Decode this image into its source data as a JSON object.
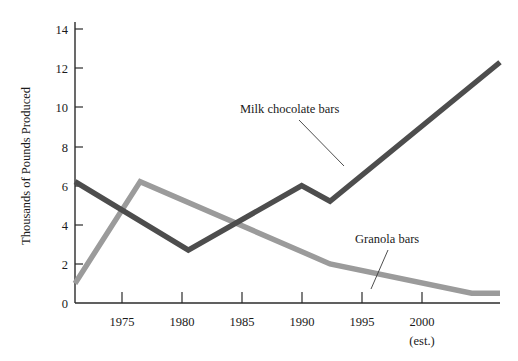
{
  "chart_data": {
    "type": "line",
    "title": "",
    "xlabel": "",
    "ylabel": "Thousands of Pounds Produced",
    "xlim": [
      1972,
      2002
    ],
    "ylim": [
      0,
      15
    ],
    "grid": false,
    "legend_position": "inline-annotations",
    "y_ticks": [
      "0",
      "2",
      "4",
      "6",
      "8",
      "10",
      "12",
      "14"
    ],
    "y_tick_values": [
      0,
      2,
      4,
      6,
      8,
      10,
      12,
      14
    ],
    "x_ticks": [
      "1975",
      "1980",
      "1985",
      "1990",
      "1995",
      "2000"
    ],
    "x_tick_values": [
      1975,
      1980,
      1985,
      1990,
      1995,
      2000
    ],
    "x_tick_sublabel": "(est.)",
    "series": [
      {
        "name": "Milk chocolate bars",
        "color": "#4d4d4d",
        "x": [
          1972,
          1980,
          1988,
          1990,
          2002
        ],
        "values": [
          6.2,
          2.7,
          6.0,
          5.2,
          12.3
        ]
      },
      {
        "name": "Granola bars",
        "color": "#9b9b9b",
        "x": [
          1972,
          1976.6,
          1990,
          2000,
          2002
        ],
        "values": [
          1.0,
          6.2,
          2.0,
          0.5,
          0.5
        ]
      }
    ],
    "annotations": [
      {
        "text": "Milk chocolate bars",
        "series": "Milk chocolate bars"
      },
      {
        "text": "Granola bars",
        "series": "Granola bars"
      }
    ]
  },
  "axis": {
    "y_title": "Thousands of Pounds Produced",
    "y_labels": {
      "t0": "0",
      "t2": "2",
      "t4": "4",
      "t6": "6",
      "t8": "8",
      "t10": "10",
      "t12": "12",
      "t14": "14"
    },
    "x_labels": {
      "t1975": "1975",
      "t1980": "1980",
      "t1985": "1985",
      "t1990": "1990",
      "t1995": "1995",
      "t2000": "2000",
      "t2000_sub": "(est.)"
    }
  },
  "labels": {
    "milk_chocolate": "Milk chocolate bars",
    "granola": "Granola bars"
  },
  "colors": {
    "milk_chocolate_line": "#4d4d4d",
    "granola_line": "#9b9b9b",
    "axis": "#2b2b2b",
    "text": "#1a1a1a",
    "background": "#ffffff"
  }
}
